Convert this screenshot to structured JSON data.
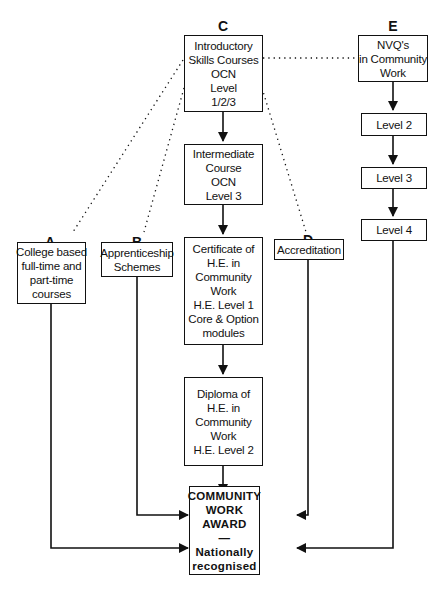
{
  "diagram": {
    "columns": {
      "A": {
        "letter": "A",
        "box_lines": [
          "College based",
          "full-time and",
          "part-time",
          "courses"
        ]
      },
      "B": {
        "letter": "B",
        "box_lines": [
          "Apprenticeship",
          "Schemes"
        ]
      },
      "C": {
        "letter": "C",
        "steps": [
          {
            "lines": [
              "Introductory",
              "Skills Courses",
              "OCN",
              "Level",
              "1/2/3"
            ]
          },
          {
            "lines": [
              "Intermediate",
              "Course",
              "OCN",
              "Level 3"
            ]
          },
          {
            "lines": [
              "Certificate of",
              "H.E. in",
              "Community",
              "Work",
              "H.E. Level 1",
              "Core & Option",
              "modules"
            ]
          },
          {
            "lines": [
              "Diploma of",
              "H.E. in",
              "Community",
              "Work",
              "H.E. Level 2"
            ]
          }
        ]
      },
      "D": {
        "letter": "D",
        "box_lines": [
          "Accreditation"
        ]
      },
      "E": {
        "letter": "E",
        "steps": [
          {
            "lines": [
              "NVQ's",
              "in Community",
              "Work"
            ]
          },
          {
            "lines": [
              "Level 2"
            ]
          },
          {
            "lines": [
              "Level 3"
            ]
          },
          {
            "lines": [
              "Level 4"
            ]
          }
        ]
      }
    },
    "award": {
      "lines": [
        "COMMUNITY",
        "WORK",
        "AWARD",
        "—",
        "Nationally",
        "recognised"
      ]
    },
    "connections": {
      "solid_arrows": [
        "C.0 -> C.1",
        "C.1 -> C.2",
        "C.2 -> C.3",
        "C.3 -> award",
        "E.0 -> E.1",
        "E.1 -> E.2",
        "E.2 -> E.3",
        "B -> award",
        "D -> award",
        "A -> award",
        "E.3 -> award"
      ],
      "dotted_links": [
        "C.0 .. A",
        "C.0 .. B",
        "C.0 .. D",
        "C.0 .. E.0"
      ]
    },
    "colors": {
      "line": "#111111",
      "background": "#ffffff"
    }
  }
}
